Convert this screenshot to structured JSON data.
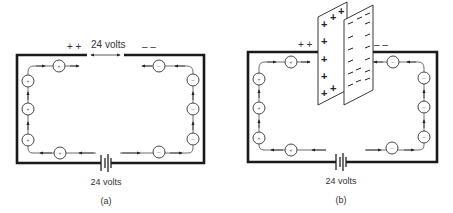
{
  "figure": {
    "panels": [
      {
        "id": "a",
        "caption": "(a)",
        "battery_label": "24 volts",
        "gap_label": "24 volts",
        "left_terminal_signs": "+ +",
        "right_terminal_signs": "– –",
        "positive_charge_symbol": "+",
        "negative_charge_symbol": "–"
      },
      {
        "id": "b",
        "caption": "(b)",
        "battery_label": "24 volts",
        "left_terminal_signs": "+ +",
        "right_terminal_signs": "– –",
        "positive_charge_symbol": "+",
        "negative_charge_symbol": "–",
        "plate_positive_symbol": "+",
        "plate_negative_symbol": "–"
      }
    ]
  }
}
